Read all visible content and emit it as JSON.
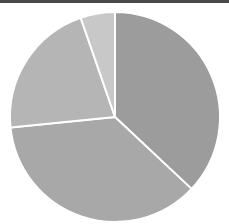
{
  "chart_data": {
    "type": "pie",
    "title": "",
    "categories": [
      "Slice A",
      "Slice B",
      "Slice C",
      "Slice D"
    ],
    "values": [
      37.0,
      36.4,
      21.3,
      5.3
    ],
    "colors": [
      "#9c9c9c",
      "#a8a8a8",
      "#b5b5b5",
      "#c8c8c8"
    ],
    "start_angle_deg": 0,
    "direction": "clockwise",
    "legend": "none",
    "labels_shown": false
  },
  "layout": {
    "top_bar_color": "#4a4a4a",
    "center": [
      115,
      117
    ],
    "radius": 105,
    "separator_color": "#ffffff"
  }
}
